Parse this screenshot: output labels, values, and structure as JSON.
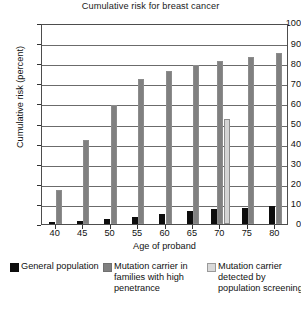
{
  "chart_data": {
    "type": "bar",
    "title": "Cumulative risk for breast cancer",
    "xlabel": "Age of proband",
    "ylabel": "Cumulative risk (percent)",
    "categories": [
      "40",
      "45",
      "50",
      "55",
      "60",
      "65",
      "70",
      "75",
      "80"
    ],
    "xlim": [
      37.5,
      82.5
    ],
    "ylim": [
      0,
      100
    ],
    "yticks": [
      "100",
      "90",
      "80",
      "70",
      "60",
      "50",
      "40",
      "30",
      "20",
      "10",
      "0"
    ],
    "ytick_values": [
      100,
      90,
      80,
      70,
      60,
      50,
      40,
      30,
      20,
      10,
      0
    ],
    "grid": true,
    "legend_position": "below",
    "series": [
      {
        "name": "General population",
        "color": "#0d0d0d",
        "values": [
          1,
          1.5,
          2.5,
          3.5,
          5,
          6.5,
          7.5,
          8,
          9
        ]
      },
      {
        "name": "Mutation carrier in families with high penetrance",
        "color": "#808080",
        "values": [
          17,
          42,
          59,
          72,
          76,
          79,
          81,
          83,
          85
        ]
      },
      {
        "name": "Mutation carrier detected by population screening",
        "color": "#d9d9d9",
        "values": [
          null,
          null,
          null,
          null,
          null,
          null,
          52,
          null,
          null
        ]
      }
    ]
  },
  "legend": {
    "items": [
      {
        "label": "General population",
        "swatch": "s-general"
      },
      {
        "label": "Mutation carrier in families with high penetrance",
        "swatch": "s-familial"
      },
      {
        "label": "Mutation carrier detected by population screening",
        "swatch": "s-screening"
      }
    ]
  }
}
